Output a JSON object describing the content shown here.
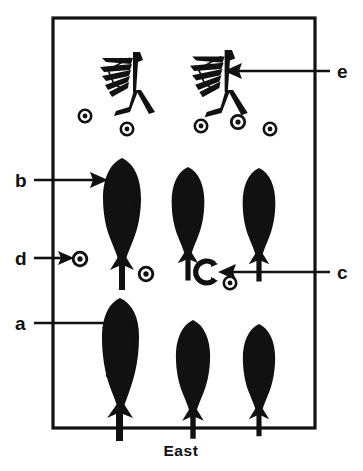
{
  "figure": {
    "caption": "East",
    "orientation_label": "East",
    "background_color": "#ffffff",
    "ink_color": "#111111",
    "frame": {
      "name": "excavation-unit-frame",
      "x": 53,
      "y": 18,
      "width": 262,
      "height": 410,
      "stroke_width": 3
    }
  },
  "callouts": [
    {
      "id": "e",
      "label": "e",
      "label_x": 339,
      "label_y": 77,
      "arrow_direction": "left",
      "line_from_x": 330,
      "line_to_x": 228,
      "line_y": 71,
      "target": "feathered-shaft-right"
    },
    {
      "id": "b",
      "label": "b",
      "label_x": 20,
      "label_y": 186,
      "arrow_direction": "right",
      "line_from_x": 32,
      "line_to_x": 100,
      "line_y": 180,
      "target": "fletched-point-top-left"
    },
    {
      "id": "d",
      "label": "d",
      "label_x": 20,
      "label_y": 264,
      "arrow_direction": "right",
      "line_from_x": 32,
      "line_to_x": 77,
      "line_y": 258,
      "target": "bead-row3-left"
    },
    {
      "id": "c",
      "label": "c",
      "label_x": 339,
      "label_y": 278,
      "arrow_direction": "left",
      "line_from_x": 330,
      "line_to_x": 228,
      "line_y": 272,
      "target": "crescent-ornament"
    },
    {
      "id": "a",
      "label": "a",
      "label_x": 20,
      "label_y": 329,
      "arrow_direction": "right",
      "line_from_x": 32,
      "line_to_x": 118,
      "line_y": 323,
      "target": "segmented-point-bottom-left"
    }
  ],
  "artifacts": {
    "feathered_shafts": [
      {
        "name": "feathered-shaft-left",
        "x": 100,
        "y": 50,
        "scale": 1.0
      },
      {
        "name": "feathered-shaft-right",
        "x": 190,
        "y": 48,
        "scale": 1.05
      }
    ],
    "fletched_points_row2": [
      {
        "name": "fletched-point-top-left",
        "x": 104,
        "y": 158,
        "scale": 1.0
      },
      {
        "name": "fletched-point-top-mid",
        "x": 172,
        "y": 167,
        "scale": 0.86
      },
      {
        "name": "fletched-point-top-right",
        "x": 243,
        "y": 168,
        "scale": 0.86
      }
    ],
    "points_row4": [
      {
        "name": "segmented-point-bottom-left",
        "x": 102,
        "y": 298,
        "scale": 1.0
      },
      {
        "name": "point-bottom-mid",
        "x": 175,
        "y": 320,
        "scale": 0.9
      },
      {
        "name": "point-bottom-right",
        "x": 243,
        "y": 324,
        "scale": 0.85
      }
    ],
    "beads_row1": [
      {
        "name": "bead-row1-a",
        "x": 85,
        "y": 116,
        "r": 7
      },
      {
        "name": "bead-row1-b",
        "x": 127,
        "y": 129,
        "r": 7
      },
      {
        "name": "bead-row1-c",
        "x": 201,
        "y": 126,
        "r": 7
      },
      {
        "name": "bead-row1-d",
        "x": 238,
        "y": 122,
        "r": 7.5
      },
      {
        "name": "bead-row1-e",
        "x": 270,
        "y": 129,
        "r": 7
      }
    ],
    "beads_row3": [
      {
        "name": "bead-row3-left",
        "x": 80,
        "y": 259,
        "r": 7.5
      },
      {
        "name": "bead-row3-mid",
        "x": 146,
        "y": 274,
        "r": 7.5
      },
      {
        "name": "bead-row3-right",
        "x": 230,
        "y": 283,
        "r": 7
      }
    ],
    "crescent": {
      "name": "crescent-ornament",
      "x": 205,
      "y": 272,
      "r": 11
    }
  }
}
